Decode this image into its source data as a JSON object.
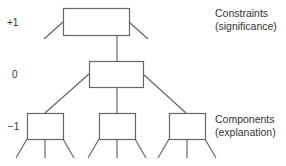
{
  "diagram": {
    "levels": [
      {
        "label": "+1"
      },
      {
        "label": "0"
      },
      {
        "label": "−1"
      }
    ],
    "annotations": {
      "top": {
        "line1": "Constraints",
        "line2": "(significance)"
      },
      "bottom": {
        "line1": "Components",
        "line2": "(explanation)"
      }
    },
    "colors": {
      "line": "#666666",
      "text": "#333333"
    }
  }
}
